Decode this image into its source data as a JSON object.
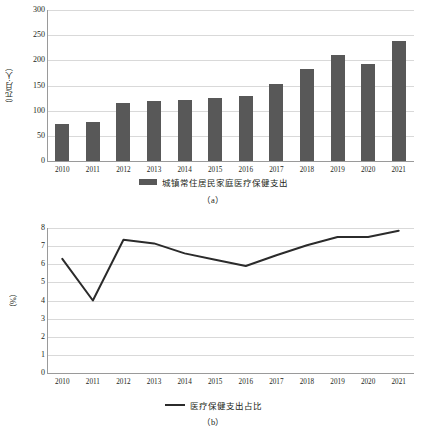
{
  "figure_a": {
    "caption": "（a）",
    "ylabel": "（元/月·人）",
    "legend_label": "城镇常住居民家庭医疗保健支出",
    "legend_swatch": "bar-swatch",
    "chart_data": {
      "type": "bar",
      "title": "",
      "xlabel": "",
      "ylabel": "（元/月·人）",
      "categories": [
        "2010",
        "2011",
        "2012",
        "2013",
        "2014",
        "2015",
        "2016",
        "2017",
        "2018",
        "2019",
        "2020",
        "2021"
      ],
      "values": [
        74,
        78,
        116,
        120,
        121,
        125,
        130,
        152,
        182,
        210,
        193,
        238
      ],
      "series": [
        {
          "name": "城镇常住居民家庭医疗保健支出",
          "values": [
            74,
            78,
            116,
            120,
            121,
            125,
            130,
            152,
            182,
            210,
            193,
            238
          ]
        }
      ],
      "ylim": [
        0,
        300
      ],
      "yticks": [
        "0",
        "50",
        "100",
        "150",
        "200",
        "250",
        "300"
      ],
      "ytick_values": [
        0,
        50,
        100,
        150,
        200,
        250,
        300
      ],
      "grid": true,
      "legend_position": "bottom",
      "bar_color": "#585858",
      "grid_color": "#d9d9d9"
    }
  },
  "figure_b": {
    "caption": "（b）",
    "ylabel": "（%）",
    "legend_label": "医疗保健支出占比",
    "legend_swatch": "line-swatch",
    "chart_data": {
      "type": "line",
      "title": "",
      "xlabel": "",
      "ylabel": "（%）",
      "categories": [
        "2010",
        "2011",
        "2012",
        "2013",
        "2014",
        "2015",
        "2016",
        "2017",
        "2018",
        "2019",
        "2020",
        "2021"
      ],
      "values": [
        6.3,
        4.0,
        7.35,
        7.15,
        6.6,
        6.25,
        5.9,
        6.5,
        7.05,
        7.5,
        7.5,
        7.85
      ],
      "series": [
        {
          "name": "医疗保健支出占比",
          "values": [
            6.3,
            4.0,
            7.35,
            7.15,
            6.6,
            6.25,
            5.9,
            6.5,
            7.05,
            7.5,
            7.5,
            7.85
          ]
        }
      ],
      "ylim": [
        0,
        8
      ],
      "yticks": [
        "0",
        "1",
        "2",
        "3",
        "4",
        "5",
        "6",
        "7",
        "8"
      ],
      "ytick_values": [
        0,
        1,
        2,
        3,
        4,
        5,
        6,
        7,
        8
      ],
      "grid": true,
      "legend_position": "bottom",
      "line_color": "#2b2b2b",
      "grid_color": "#d9d9d9"
    }
  }
}
